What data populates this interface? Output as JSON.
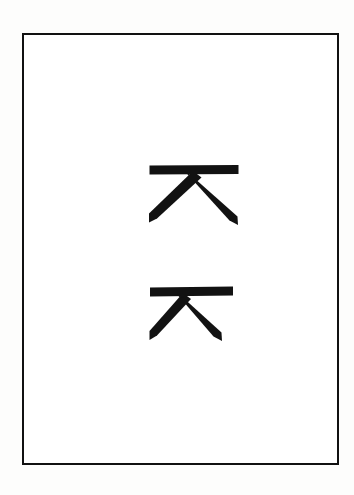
{
  "figure": {
    "background_color": "#ffffff",
    "ink_color": "#121212",
    "frame": {
      "name": "page-border",
      "stroke_color": "#111111",
      "stroke_width_px": 2.5,
      "x": 22,
      "y": 33,
      "width": 317,
      "height": 432
    },
    "glyphs": [
      {
        "id": "glyph-upper",
        "character": "ᄌ",
        "romanization": "j",
        "name": "jieut",
        "script": "Hangul",
        "position": "upper",
        "x": 140,
        "y": 158,
        "width": 106,
        "height": 74,
        "stroke_count": 3,
        "strokes": [
          "horizontal-top-bar",
          "diagonal-down-left",
          "diagonal-down-right"
        ]
      },
      {
        "id": "glyph-lower",
        "character": "ᄌ",
        "romanization": "j",
        "name": "jieut",
        "script": "Hangul",
        "position": "lower",
        "x": 140,
        "y": 282,
        "width": 106,
        "height": 66,
        "stroke_count": 3,
        "strokes": [
          "horizontal-top-bar",
          "diagonal-down-left",
          "diagonal-down-right"
        ]
      }
    ]
  }
}
